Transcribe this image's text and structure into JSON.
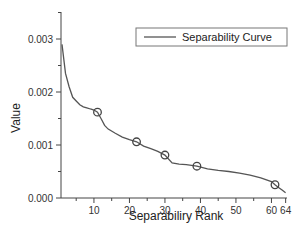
{
  "chart_data": {
    "type": "line",
    "title": "",
    "xlabel": "Separabiliry Rank",
    "ylabel": "Value",
    "xlim": [
      1,
      64
    ],
    "ylim": [
      0,
      0.0035
    ],
    "grid": false,
    "legend_position": "upper right",
    "x_ticks": [
      10,
      20,
      30,
      40,
      50,
      60,
      64
    ],
    "x_tick_labels": [
      "10",
      "20",
      "30",
      "40",
      "50",
      "60",
      "64"
    ],
    "y_ticks": [
      0.0,
      0.001,
      0.002,
      0.003
    ],
    "y_tick_labels": [
      "0.000",
      "0.001",
      "0.002",
      "0.003"
    ],
    "series": [
      {
        "name": "Separability Curve",
        "color": "#555555",
        "x": [
          1,
          2,
          3,
          4,
          5,
          6,
          7,
          8,
          9,
          10,
          11,
          12,
          13,
          14,
          16,
          18,
          20,
          22,
          24,
          26,
          28,
          30,
          32,
          34,
          36,
          39,
          42,
          45,
          48,
          51,
          54,
          57,
          60,
          61,
          62,
          63,
          64
        ],
        "values": [
          0.0029,
          0.00235,
          0.0021,
          0.0019,
          0.00183,
          0.00176,
          0.00172,
          0.0017,
          0.00168,
          0.00166,
          0.00162,
          0.0015,
          0.00137,
          0.0013,
          0.00122,
          0.00115,
          0.0011,
          0.00106,
          0.00098,
          0.00093,
          0.00088,
          0.00081,
          0.00066,
          0.00064,
          0.00063,
          0.0006,
          0.00055,
          0.00052,
          0.0005,
          0.00047,
          0.00043,
          0.00038,
          0.00031,
          0.00025,
          0.0002,
          0.00015,
          0.0001
        ]
      }
    ],
    "markers": {
      "shape": "open-circle",
      "points": [
        {
          "x": 11,
          "y": 0.00162
        },
        {
          "x": 22,
          "y": 0.00106
        },
        {
          "x": 30,
          "y": 0.00081
        },
        {
          "x": 39,
          "y": 0.0006
        },
        {
          "x": 61,
          "y": 0.00025
        }
      ]
    }
  },
  "legend": {
    "entries": [
      {
        "label": "Separability Curve"
      }
    ]
  },
  "axes": {
    "xlabel": "Separabiliry Rank",
    "ylabel": "Value"
  }
}
